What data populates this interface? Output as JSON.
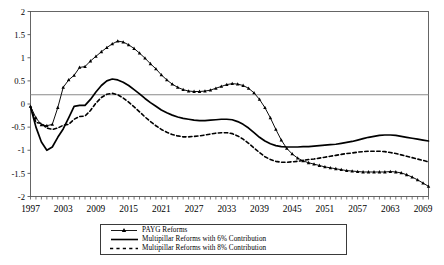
{
  "chart_data": {
    "type": "line",
    "title": "",
    "xlabel": "",
    "ylabel": "",
    "xlim": [
      1997,
      2070
    ],
    "ylim": [
      -2,
      2
    ],
    "yticks": [
      "2",
      "1.5",
      "1",
      "0.5",
      "0",
      "-0.5",
      "-1",
      "-1.5",
      "-2"
    ],
    "ytick_values": [
      2,
      1.5,
      1,
      0.5,
      0,
      -0.5,
      -1,
      -1.5,
      -2
    ],
    "xticks": [
      "1997",
      "2003",
      "2009",
      "2015",
      "2021",
      "2027",
      "2033",
      "2039",
      "2045",
      "2051",
      "2057",
      "2063",
      "2069"
    ],
    "xtick_values": [
      1997,
      2003,
      2009,
      2015,
      2021,
      2027,
      2033,
      2039,
      2045,
      2051,
      2057,
      2063,
      2069
    ],
    "grid": false,
    "reference_line": 0.2,
    "legend_position": "bottom",
    "series": [
      {
        "name": "PAYG Reforms",
        "style": "solid-with-markers",
        "marker": "triangle",
        "x": [
          1997,
          1998,
          1999,
          2000,
          2001,
          2002,
          2003,
          2004,
          2005,
          2006,
          2007,
          2008,
          2009,
          2010,
          2011,
          2012,
          2013,
          2014,
          2015,
          2016,
          2017,
          2018,
          2019,
          2020,
          2021,
          2022,
          2023,
          2024,
          2025,
          2026,
          2027,
          2028,
          2029,
          2030,
          2031,
          2032,
          2033,
          2034,
          2035,
          2036,
          2037,
          2038,
          2039,
          2040,
          2041,
          2042,
          2043,
          2044,
          2045,
          2046,
          2047,
          2048,
          2049,
          2050,
          2051,
          2052,
          2053,
          2054,
          2055,
          2056,
          2057,
          2058,
          2059,
          2060,
          2061,
          2062,
          2063,
          2064,
          2065,
          2066,
          2067,
          2068,
          2069,
          2070
        ],
        "y": [
          -0.05,
          -0.3,
          -0.45,
          -0.47,
          -0.44,
          -0.08,
          0.36,
          0.52,
          0.62,
          0.79,
          0.81,
          0.93,
          1.03,
          1.13,
          1.22,
          1.3,
          1.36,
          1.34,
          1.28,
          1.2,
          1.1,
          0.99,
          0.87,
          0.76,
          0.63,
          0.52,
          0.43,
          0.36,
          0.31,
          0.28,
          0.27,
          0.27,
          0.28,
          0.3,
          0.34,
          0.38,
          0.42,
          0.44,
          0.43,
          0.4,
          0.34,
          0.24,
          0.1,
          -0.08,
          -0.3,
          -0.55,
          -0.78,
          -0.96,
          -1.08,
          -1.17,
          -1.23,
          -1.27,
          -1.3,
          -1.33,
          -1.36,
          -1.38,
          -1.4,
          -1.42,
          -1.44,
          -1.45,
          -1.46,
          -1.47,
          -1.47,
          -1.47,
          -1.47,
          -1.47,
          -1.46,
          -1.47,
          -1.49,
          -1.53,
          -1.58,
          -1.64,
          -1.71,
          -1.78
        ]
      },
      {
        "name": "Multipillar Reforms with 6% Contribution",
        "style": "solid",
        "marker": "none",
        "x": [
          1997,
          1998,
          1999,
          2000,
          2001,
          2002,
          2003,
          2004,
          2005,
          2006,
          2007,
          2008,
          2009,
          2010,
          2011,
          2012,
          2013,
          2014,
          2015,
          2016,
          2017,
          2018,
          2019,
          2020,
          2021,
          2022,
          2023,
          2024,
          2025,
          2026,
          2027,
          2028,
          2029,
          2030,
          2031,
          2032,
          2033,
          2034,
          2035,
          2036,
          2037,
          2038,
          2039,
          2040,
          2041,
          2042,
          2043,
          2044,
          2045,
          2046,
          2047,
          2048,
          2049,
          2050,
          2051,
          2052,
          2053,
          2054,
          2055,
          2056,
          2057,
          2058,
          2059,
          2060,
          2061,
          2062,
          2063,
          2064,
          2065,
          2066,
          2067,
          2068,
          2069,
          2070
        ],
        "y": [
          -0.06,
          -0.5,
          -0.82,
          -1.0,
          -0.93,
          -0.72,
          -0.54,
          -0.3,
          -0.05,
          -0.03,
          -0.03,
          0.1,
          0.26,
          0.4,
          0.5,
          0.54,
          0.52,
          0.47,
          0.4,
          0.31,
          0.22,
          0.12,
          0.03,
          -0.05,
          -0.13,
          -0.19,
          -0.24,
          -0.28,
          -0.31,
          -0.33,
          -0.35,
          -0.36,
          -0.36,
          -0.35,
          -0.34,
          -0.33,
          -0.33,
          -0.34,
          -0.38,
          -0.44,
          -0.52,
          -0.62,
          -0.72,
          -0.8,
          -0.86,
          -0.9,
          -0.92,
          -0.93,
          -0.93,
          -0.93,
          -0.92,
          -0.92,
          -0.91,
          -0.9,
          -0.89,
          -0.88,
          -0.87,
          -0.85,
          -0.83,
          -0.81,
          -0.78,
          -0.75,
          -0.72,
          -0.7,
          -0.68,
          -0.67,
          -0.67,
          -0.68,
          -0.7,
          -0.72,
          -0.74,
          -0.76,
          -0.78,
          -0.8
        ]
      },
      {
        "name": "Multipillar Reforms with 8% Contribution",
        "style": "dashed",
        "marker": "none",
        "x": [
          1997,
          1998,
          1999,
          2000,
          2001,
          2002,
          2003,
          2004,
          2005,
          2006,
          2007,
          2008,
          2009,
          2010,
          2011,
          2012,
          2013,
          2014,
          2015,
          2016,
          2017,
          2018,
          2019,
          2020,
          2021,
          2022,
          2023,
          2024,
          2025,
          2026,
          2027,
          2028,
          2029,
          2030,
          2031,
          2032,
          2033,
          2034,
          2035,
          2036,
          2037,
          2038,
          2039,
          2040,
          2041,
          2042,
          2043,
          2044,
          2045,
          2046,
          2047,
          2048,
          2049,
          2050,
          2051,
          2052,
          2053,
          2054,
          2055,
          2056,
          2057,
          2058,
          2059,
          2060,
          2061,
          2062,
          2063,
          2064,
          2065,
          2066,
          2067,
          2068,
          2069,
          2070
        ],
        "y": [
          -0.06,
          -0.4,
          -0.42,
          -0.52,
          -0.55,
          -0.52,
          -0.46,
          -0.44,
          -0.33,
          -0.27,
          -0.26,
          -0.14,
          0.02,
          0.14,
          0.21,
          0.23,
          0.2,
          0.13,
          0.04,
          -0.06,
          -0.17,
          -0.28,
          -0.38,
          -0.47,
          -0.55,
          -0.61,
          -0.66,
          -0.69,
          -0.71,
          -0.71,
          -0.7,
          -0.69,
          -0.67,
          -0.65,
          -0.63,
          -0.62,
          -0.62,
          -0.64,
          -0.69,
          -0.76,
          -0.85,
          -0.95,
          -1.05,
          -1.14,
          -1.2,
          -1.24,
          -1.26,
          -1.26,
          -1.25,
          -1.24,
          -1.22,
          -1.2,
          -1.19,
          -1.17,
          -1.15,
          -1.13,
          -1.11,
          -1.09,
          -1.07,
          -1.06,
          -1.04,
          -1.03,
          -1.02,
          -1.02,
          -1.02,
          -1.03,
          -1.05,
          -1.07,
          -1.1,
          -1.13,
          -1.16,
          -1.19,
          -1.22,
          -1.25
        ]
      }
    ]
  },
  "legend": {
    "items": [
      {
        "label": "PAYG Reforms",
        "symbol": "line-with-triangle-markers"
      },
      {
        "label": "Multipillar Reforms with 6% Contribution",
        "symbol": "solid-line"
      },
      {
        "label": "Multipillar Reforms with 8% Contribution",
        "symbol": "dashed-line"
      }
    ]
  }
}
